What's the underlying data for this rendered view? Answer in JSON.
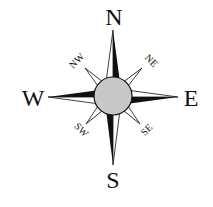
{
  "compass": {
    "title": "Compass rose",
    "colors": {
      "ink": "#111111",
      "background": "#ffffff",
      "hub": "#c8c8c8"
    },
    "cardinal_labels": {
      "north": "N",
      "east": "E",
      "south": "S",
      "west": "W"
    },
    "ordinal_labels": {
      "northeast": "NE",
      "southeast": "SE",
      "southwest": "SW",
      "northwest": "NW"
    }
  }
}
